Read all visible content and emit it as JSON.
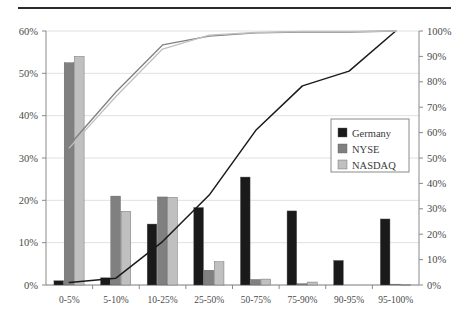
{
  "chart_data": {
    "type": "bar",
    "title": "",
    "subtitle": "",
    "xlabel": "",
    "ylabel": "",
    "categories": [
      "0-5%",
      "5-10%",
      "10-25%",
      "25-50%",
      "50-75%",
      "75-90%",
      "90-95%",
      "95-100%"
    ],
    "series": [
      {
        "name": "Germany",
        "type": "bar",
        "color": "#1a1a1a",
        "axis": "left",
        "values": [
          1.0,
          1.7,
          14.4,
          18.3,
          25.5,
          17.5,
          5.8,
          15.6
        ]
      },
      {
        "name": "NYSE",
        "type": "bar",
        "color": "#808080",
        "axis": "left",
        "values": [
          52.5,
          21.0,
          20.8,
          3.5,
          1.3,
          0.3,
          0.0,
          0.2
        ]
      },
      {
        "name": "NASDAQ",
        "type": "bar",
        "color": "#c0c0c0",
        "axis": "left",
        "values": [
          54.0,
          17.4,
          20.7,
          5.5,
          1.4,
          0.7,
          0.0,
          0.1
        ]
      },
      {
        "name": "Germany cumulative",
        "type": "line",
        "color": "#1a1a1a",
        "axis": "right",
        "values": [
          1.0,
          2.7,
          17.1,
          35.4,
          60.9,
          78.4,
          84.2,
          100.0
        ]
      },
      {
        "name": "NYSE cumulative",
        "type": "line",
        "color": "#808080",
        "axis": "right",
        "values": [
          55.0,
          76.0,
          94.5,
          98.0,
          99.3,
          99.6,
          99.6,
          100.0
        ]
      },
      {
        "name": "NASDAQ cumulative",
        "type": "line",
        "color": "#c0c0c0",
        "axis": "right",
        "values": [
          54.0,
          74.2,
          92.9,
          98.4,
          99.4,
          99.8,
          99.8,
          100.0
        ]
      }
    ],
    "left_axis": {
      "ticks": [
        "0%",
        "10%",
        "20%",
        "30%",
        "40%",
        "50%",
        "60%"
      ],
      "values": [
        0,
        10,
        20,
        30,
        40,
        50,
        60
      ],
      "min": 0,
      "max": 60
    },
    "right_axis": {
      "ticks": [
        "0%",
        "10%",
        "20%",
        "30%",
        "40%",
        "50%",
        "60%",
        "70%",
        "80%",
        "90%",
        "100%"
      ],
      "values": [
        0,
        10,
        20,
        30,
        40,
        50,
        60,
        70,
        80,
        90,
        100
      ],
      "min": 0,
      "max": 100
    },
    "grid": true,
    "legend": {
      "position": "right-middle",
      "entries": [
        {
          "label": "Germany",
          "color": "#1a1a1a"
        },
        {
          "label": "NYSE",
          "color": "#808080"
        },
        {
          "label": "NASDAQ",
          "color": "#c0c0c0"
        }
      ]
    }
  }
}
